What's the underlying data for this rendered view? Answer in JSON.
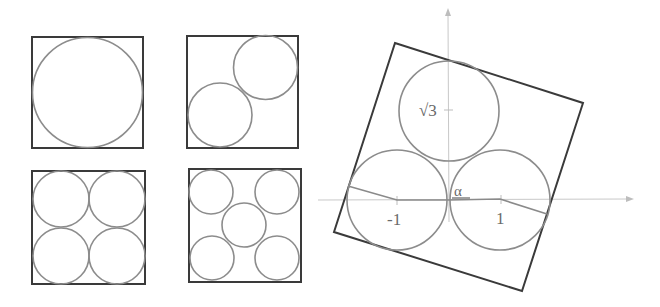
{
  "figure": {
    "panels": [
      {
        "id": "n1",
        "circle_count": 1
      },
      {
        "id": "n2",
        "circle_count": 2
      },
      {
        "id": "n4",
        "circle_count": 4
      },
      {
        "id": "n5",
        "circle_count": 5
      }
    ],
    "rotated_panel": {
      "circle_count": 3,
      "labels": {
        "sqrt3": "√3",
        "alpha": "α",
        "neg_one": "-1",
        "one": "1"
      }
    }
  },
  "colors": {
    "square_stroke": "#3a3a3a",
    "circle_stroke": "#8c8c8c",
    "axis_stroke": "#c8c8c8",
    "label_color": "#6a6a6a"
  }
}
